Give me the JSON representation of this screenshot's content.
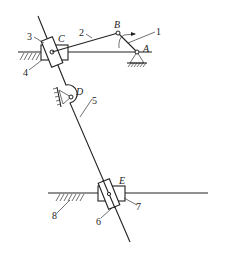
{
  "diagram": {
    "type": "mechanism-kinematic-sketch",
    "joints": [
      {
        "id": "A",
        "label": "A",
        "kind": "fixed-pivot"
      },
      {
        "id": "B",
        "label": "B",
        "kind": "revolute"
      },
      {
        "id": "C",
        "label": "C",
        "kind": "revolute-slider"
      },
      {
        "id": "D",
        "label": "D",
        "kind": "fixed-pivot"
      },
      {
        "id": "E",
        "label": "E",
        "kind": "revolute-slider"
      }
    ],
    "members": [
      {
        "id": "1",
        "label": "1",
        "description": "crank AB"
      },
      {
        "id": "2",
        "label": "2",
        "description": "link BC"
      },
      {
        "id": "3",
        "label": "3",
        "description": "slider block at C"
      },
      {
        "id": "4",
        "label": "4",
        "description": "horizontal slider guide at C"
      },
      {
        "id": "5",
        "label": "5",
        "description": "long rocker through D"
      },
      {
        "id": "6",
        "label": "6",
        "description": "slider block at E"
      },
      {
        "id": "7",
        "label": "7",
        "description": "horizontal slider at E"
      },
      {
        "id": "8",
        "label": "8",
        "description": "frame / ground"
      }
    ],
    "annotations": {
      "rotation_arrow": "clockwise-arrow at B indicating crank 1 rotation"
    }
  }
}
